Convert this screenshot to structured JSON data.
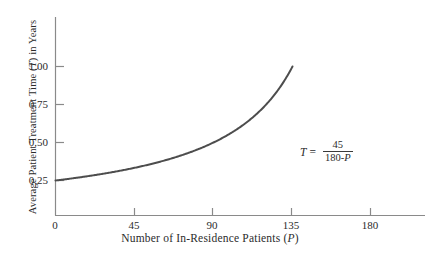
{
  "chart_data": {
    "type": "line",
    "title": "",
    "xlabel": "Number of In-Residence Patients (P)",
    "xlabel_main": "Number of In-Residence Patients (",
    "xlabel_var": "P",
    "xlabel_tail": ")",
    "ylabel": "Average Patient Treatment Time (T) in Years",
    "ylabel_main": "Average Patient Treatment Time (",
    "ylabel_var": "T",
    "ylabel_tail": ") in Years",
    "xlim": [
      0,
      205
    ],
    "ylim": [
      0,
      1.22
    ],
    "xticks": [
      0,
      45,
      90,
      135,
      180
    ],
    "xtick_labels": [
      "0",
      "45",
      "90",
      "135",
      "180"
    ],
    "yticks": [
      0.25,
      0.5,
      0.75,
      1.0
    ],
    "ytick_labels": [
      "0.25",
      "0.50",
      "0.75",
      "1.00"
    ],
    "grid": false,
    "legend": "none",
    "equation": {
      "lhs": "T",
      "operator": "=",
      "numerator": "45",
      "denominator": "180-P",
      "denominator_const": "180-",
      "denominator_var": "P"
    },
    "series": [
      {
        "name": "T = 45/(180-P)",
        "color": "#4d4d4d",
        "line_width": 2.0,
        "x": [
          0,
          9,
          18,
          27,
          36,
          45,
          54,
          63,
          72,
          81,
          90,
          99,
          108,
          117,
          126,
          135
        ],
        "y": [
          0.25,
          0.2632,
          0.2778,
          0.2941,
          0.3125,
          0.3333,
          0.3571,
          0.3846,
          0.4167,
          0.4545,
          0.5,
          0.5556,
          0.625,
          0.7143,
          0.8333,
          1.0
        ]
      }
    ],
    "axis_color": "#8a8a8a",
    "text_color": "#2b2b2b",
    "background": "#ffffff"
  }
}
